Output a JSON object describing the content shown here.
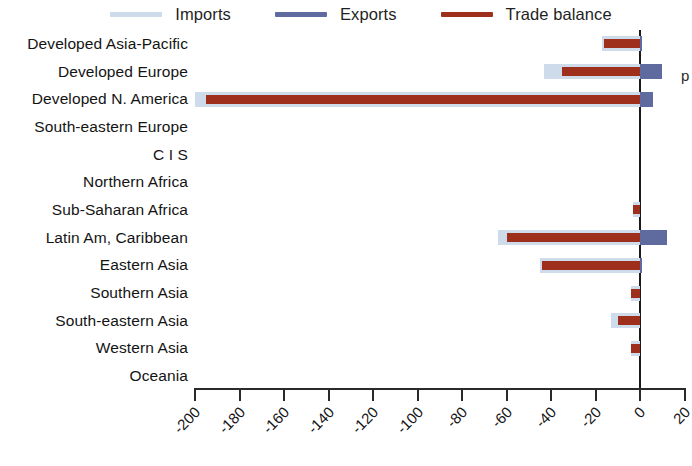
{
  "legend": {
    "position": "top",
    "items": [
      {
        "label": "Imports",
        "color": "#cddbeb",
        "name": "imports"
      },
      {
        "label": "Exports",
        "color": "#5f6a9e",
        "name": "exports"
      },
      {
        "label": "Trade balance",
        "color": "#9e2f1c",
        "name": "trade-balance"
      }
    ]
  },
  "edge_artifact": {
    "text": "p"
  },
  "axis": {
    "ticks": [
      "-200",
      "-180",
      "-160",
      "-140",
      "-120",
      "-100",
      "-80",
      "-60",
      "-40",
      "-20",
      "0",
      "20"
    ],
    "tick_values": [
      -200,
      -180,
      -160,
      -140,
      -120,
      -100,
      -80,
      -60,
      -40,
      -20,
      0,
      20
    ]
  },
  "chart_data": {
    "type": "bar",
    "orientation": "horizontal",
    "title": "",
    "subtitle": "",
    "xlabel": "",
    "ylabel": "",
    "xlim": [
      -205,
      23
    ],
    "grid": false,
    "legend_position": "top",
    "categories": [
      "Developed Asia-Pacific",
      "Developed Europe",
      "Developed N. America",
      "South-eastern Europe",
      "C I S",
      "Northern Africa",
      "Sub-Saharan Africa",
      "Latin Am, Caribbean",
      "Eastern Asia",
      "Southern Asia",
      "South-eastern Asia",
      "Western Asia",
      "Oceania"
    ],
    "series": [
      {
        "name": "Imports",
        "color": "#cddbeb",
        "values": [
          -17,
          -43,
          -200,
          0,
          0,
          0,
          -3,
          -64,
          -45,
          -4,
          -13,
          -4,
          0
        ]
      },
      {
        "name": "Exports",
        "color": "#5f6a9e",
        "values": [
          1,
          10,
          6,
          0,
          0,
          0,
          0,
          12,
          1,
          0,
          0,
          0,
          0
        ]
      },
      {
        "name": "Trade balance",
        "color": "#9e2f1c",
        "values": [
          -16,
          -35,
          -195,
          0,
          0,
          0,
          -3,
          -60,
          -44,
          -4,
          -10,
          -4,
          0
        ]
      }
    ]
  }
}
